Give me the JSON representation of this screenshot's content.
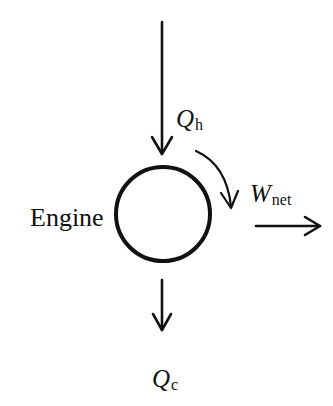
{
  "diagram": {
    "type": "heat-engine-schematic",
    "engine": {
      "label": "Engine",
      "shape": "circle",
      "stroke_color": "#111111"
    },
    "heat_in": {
      "symbol": "Q",
      "subscript": "h",
      "direction": "down-into-engine"
    },
    "heat_out": {
      "symbol": "Q",
      "subscript": "c",
      "direction": "down-out-of-engine"
    },
    "work_out": {
      "symbol": "W",
      "subscript": "net",
      "direction": "right-out-of-engine"
    },
    "rotation_arrow": {
      "direction": "clockwise"
    },
    "colors": {
      "line": "#111111",
      "background": "#ffffff"
    }
  }
}
